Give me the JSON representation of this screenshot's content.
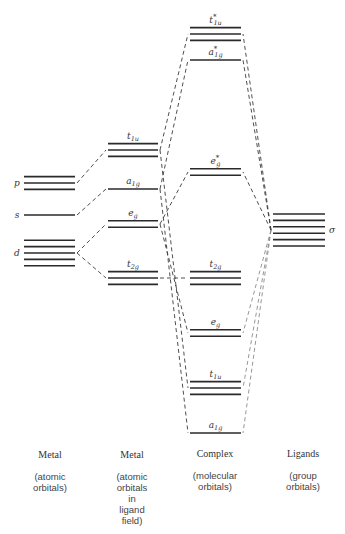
{
  "diagram": {
    "columns": [
      {
        "heading": "Metal",
        "description": "(atomic\norbitals)"
      },
      {
        "heading": "Metal",
        "description": "(atomic\norbitals\nin\nligand\nfield)"
      },
      {
        "heading": "Complex",
        "description": "(molecular\norbitals)"
      },
      {
        "heading": "Ligands",
        "description": "(group\norbitals)"
      }
    ],
    "metal_atomic": [
      {
        "label": "p",
        "degeneracy": 3
      },
      {
        "label": "s",
        "degeneracy": 1
      },
      {
        "label": "d",
        "degeneracy": 5
      }
    ],
    "metal_ligand_field": [
      {
        "label": "t",
        "sub": "1u",
        "degeneracy": 3
      },
      {
        "label": "a",
        "sub": "1g",
        "degeneracy": 1
      },
      {
        "label": "e",
        "sub": "g",
        "degeneracy": 2
      },
      {
        "label": "t",
        "sub": "2g",
        "degeneracy": 3
      }
    ],
    "complex": [
      {
        "label": "t",
        "sub": "1u",
        "star": "*",
        "degeneracy": 3
      },
      {
        "label": "a",
        "sub": "1g",
        "star": "*",
        "degeneracy": 1
      },
      {
        "label": "e",
        "sub": "g",
        "star": "*",
        "degeneracy": 2
      },
      {
        "label": "t",
        "sub": "2g",
        "star": "",
        "degeneracy": 3
      },
      {
        "label": "e",
        "sub": "g",
        "star": "",
        "degeneracy": 2
      },
      {
        "label": "t",
        "sub": "1u",
        "star": "",
        "degeneracy": 3
      },
      {
        "label": "a",
        "sub": "1g",
        "star": "",
        "degeneracy": 1
      }
    ],
    "ligands": [
      {
        "label": "σ",
        "degeneracy": 6
      }
    ]
  }
}
